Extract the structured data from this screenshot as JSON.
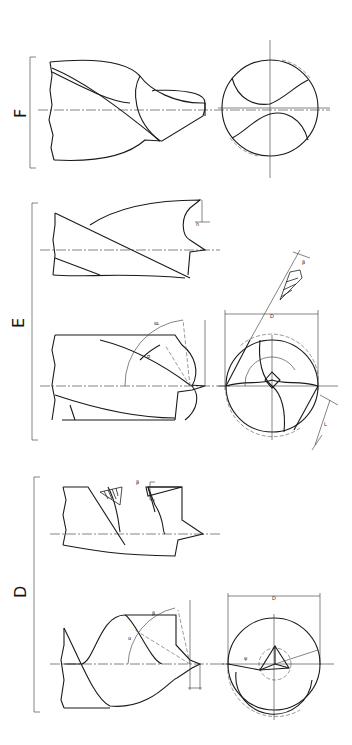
{
  "figure": {
    "sections": [
      {
        "id": "F",
        "label": "F"
      },
      {
        "id": "E",
        "label": "E"
      },
      {
        "id": "D",
        "label": "D"
      }
    ],
    "symbols": {
      "diameter": "D",
      "alpha": "α",
      "beta": "β",
      "lip_length": "L",
      "small_dims": [
        "h",
        "s",
        "r",
        "c"
      ]
    }
  }
}
